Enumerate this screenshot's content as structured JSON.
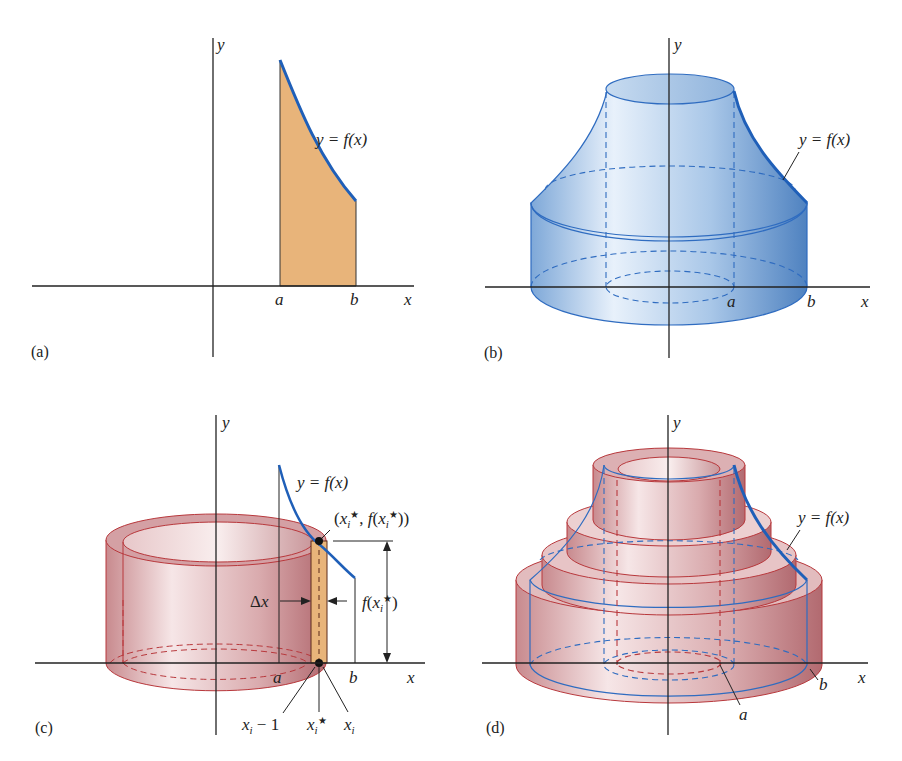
{
  "figure": {
    "panels": [
      {
        "id": "a",
        "label": "(a)",
        "axis_x": "x",
        "axis_y": "y",
        "curve_label": "y = f(x)",
        "ticks": [
          "a",
          "b"
        ],
        "description": "Region under y = f(x) between a and b, shaded orange"
      },
      {
        "id": "b",
        "label": "(b)",
        "axis_x": "x",
        "axis_y": "y",
        "curve_label": "y = f(x)",
        "ticks": [
          "a",
          "b"
        ],
        "description": "Solid of revolution obtained by rotating the region about the y-axis (blue)"
      },
      {
        "id": "c",
        "label": "(c)",
        "axis_x": "x",
        "axis_y": "y",
        "curve_label": "y = f(x)",
        "ticks": [
          "a",
          "b"
        ],
        "point_label": "(xi*, f(xi*))",
        "height_label": "f(xi*)",
        "width_label": "Δx",
        "bottom_labels": [
          "xi − 1",
          "xi*",
          "xi"
        ],
        "description": "A single cylindrical shell generated by rotating a thin rectangle (red shell)"
      },
      {
        "id": "d",
        "label": "(d)",
        "axis_x": "x",
        "axis_y": "y",
        "curve_label": "y = f(x)",
        "ticks": [
          "a",
          "b"
        ],
        "description": "Solid approximated by a stack of cylindrical shells (red) with outline of true solid (blue)"
      }
    ],
    "colors": {
      "curve_blue": "#1f5fb8",
      "region_fill": "#e8b47a",
      "solid_blue": "#9fc1e6",
      "shell_red": "#c98a8e",
      "shell_edge": "#b8383c",
      "axis": "#222222"
    }
  }
}
